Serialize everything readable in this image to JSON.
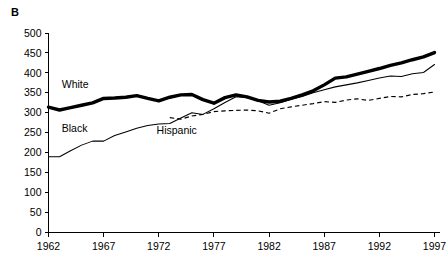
{
  "panel": {
    "label": "B"
  },
  "chart_data": {
    "type": "line",
    "title": "",
    "subtitle": "",
    "xlabel": "",
    "ylabel": "",
    "xlim": [
      1962,
      1997
    ],
    "ylim": [
      0,
      500
    ],
    "grid": false,
    "legend_position": "inline-annotations",
    "x_tick_labels": [
      "1962",
      "1967",
      "1972",
      "1977",
      "1982",
      "1987",
      "1992",
      "1997"
    ],
    "x_ticks": [
      1962,
      1967,
      1972,
      1977,
      1982,
      1987,
      1992,
      1997
    ],
    "y_tick_labels": [
      "0",
      "50",
      "100",
      "150",
      "200",
      "250",
      "300",
      "350",
      "400",
      "450",
      "500"
    ],
    "y_ticks": [
      0,
      50,
      100,
      150,
      200,
      250,
      300,
      350,
      400,
      450,
      500
    ],
    "x": [
      1962,
      1963,
      1964,
      1965,
      1966,
      1967,
      1968,
      1969,
      1970,
      1971,
      1972,
      1973,
      1974,
      1975,
      1976,
      1977,
      1978,
      1979,
      1980,
      1981,
      1982,
      1983,
      1984,
      1985,
      1986,
      1987,
      1988,
      1989,
      1990,
      1991,
      1992,
      1993,
      1994,
      1995,
      1996,
      1997
    ],
    "series": [
      {
        "name": "White",
        "style": "thick-solid",
        "color": "#000000",
        "label_text": "White",
        "values": [
          314,
          307,
          313,
          319,
          325,
          336,
          337,
          339,
          343,
          336,
          330,
          339,
          345,
          346,
          333,
          324,
          338,
          345,
          340,
          331,
          327,
          329,
          336,
          345,
          355,
          370,
          387,
          390,
          397,
          404,
          411,
          419,
          425,
          433,
          440,
          451
        ]
      },
      {
        "name": "Black",
        "style": "thin-solid",
        "color": "#000000",
        "label_text": "Black",
        "values": [
          190,
          190,
          205,
          219,
          229,
          229,
          243,
          252,
          261,
          268,
          272,
          273,
          287,
          300,
          296,
          310,
          326,
          340,
          338,
          330,
          319,
          325,
          334,
          341,
          350,
          358,
          365,
          370,
          375,
          381,
          387,
          392,
          391,
          398,
          401,
          421
        ]
      },
      {
        "name": "Hispanic",
        "style": "dashed",
        "color": "#000000",
        "label_text": "Hispanic",
        "values": [
          null,
          null,
          null,
          null,
          null,
          null,
          null,
          null,
          null,
          null,
          null,
          288,
          284,
          292,
          296,
          303,
          305,
          306,
          307,
          305,
          299,
          310,
          315,
          319,
          323,
          328,
          326,
          332,
          335,
          331,
          336,
          341,
          340,
          346,
          348,
          352
        ]
      }
    ],
    "annotations": [
      {
        "text": "White",
        "x": 1963.2,
        "y": 362
      },
      {
        "text": "Black",
        "x": 1963.2,
        "y": 252
      },
      {
        "text": "Hispanic",
        "x": 1971.8,
        "y": 248
      }
    ]
  }
}
